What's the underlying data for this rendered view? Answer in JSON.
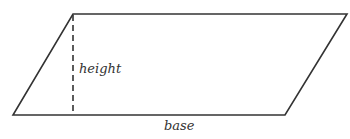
{
  "diagram": {
    "shape": "parallelogram",
    "labels": {
      "height": "height",
      "base": "base"
    },
    "stroke_color": "#333333",
    "vertices": {
      "top_left": [
        73,
        14
      ],
      "top_right": [
        347,
        14
      ],
      "bottom_right": [
        285,
        115
      ],
      "bottom_left": [
        13,
        115
      ]
    }
  }
}
